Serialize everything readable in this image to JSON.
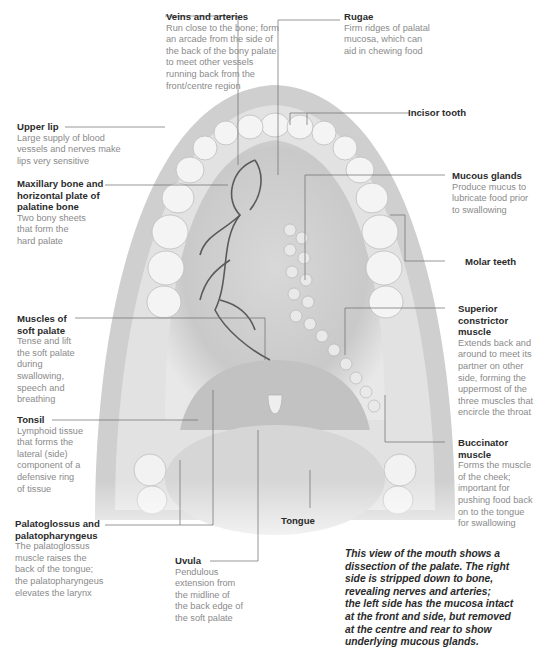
{
  "labels": {
    "veins": {
      "title": "Veins and arteries",
      "desc": "Run close to the bone; form\nan arcade from the side of\nthe back of the bony palate\nto meet other vessels\nrunning back from the\nfront/centre region"
    },
    "rugae": {
      "title": "Rugae",
      "desc": "Firm ridges of palatal\nmucosa, which can\naid in chewing food"
    },
    "incisor": {
      "title": "Incisor tooth"
    },
    "upper_lip": {
      "title": "Upper lip",
      "desc": "Large supply of blood\nvessels and nerves make\nlips very sensitive"
    },
    "maxillary": {
      "title": "Maxillary bone and\nhorizontal plate of\npalatine bone",
      "desc": "Two bony sheets\nthat form the\nhard palate"
    },
    "mucous": {
      "title": "Mucous glands",
      "desc": "Produce mucus to\nlubricate food prior\nto swallowing"
    },
    "molar": {
      "title": "Molar teeth"
    },
    "superior": {
      "title": "Superior\nconstrictor\nmuscle",
      "desc": "Extends back and\naround to meet its\npartner on other\nside, forming the\nuppermost of the\nthree muscles that\nencircle the throat"
    },
    "soft_palate": {
      "title": "Muscles of\nsoft palate",
      "desc": "Tense and lift\nthe soft palate\nduring\nswallowing,\nspeech and\nbreathing"
    },
    "tonsil": {
      "title": "Tonsil",
      "desc": "Lymphoid tissue\nthat forms the\nlateral (side)\ncomponent of a\ndefensive ring\nof tissue"
    },
    "buccinator": {
      "title": "Buccinator\nmuscle",
      "desc": "Forms the muscle\nof the cheek;\nimportant for\npushing food back\non to the tongue\nfor swallowing"
    },
    "palato": {
      "title": "Palatoglossus and\npalatopharyngeus",
      "desc": "The palatoglossus\nmuscle raises the\nback of the tongue;\nthe palatopharyngeus\nelevates the larynx"
    },
    "tongue": {
      "title": "Tongue"
    },
    "uvula": {
      "title": "Uvula",
      "desc": "Pendulous\nextension from\nthe midline of\nthe back edge of\nthe soft palate"
    }
  },
  "caption": "This view of the mouth shows a\ndissection of the palate. The right\nside is stripped down to bone,\nrevealing nerves and arteries;\nthe left side has the mucosa intact\nat the front and side, but removed\nat the centre and rear to show\nunderlying mucous glands.",
  "colors": {
    "title": "#2b2b2b",
    "desc": "#8a8a8a",
    "leader": "#6a6a6a",
    "vessel": "#5a5a5a"
  }
}
